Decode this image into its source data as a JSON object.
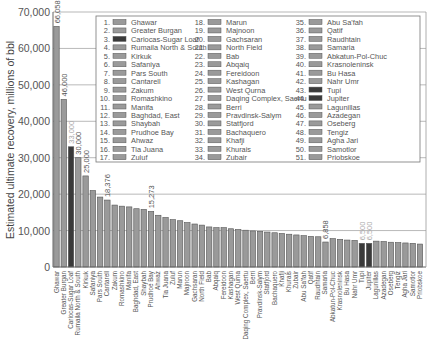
{
  "chart_data": {
    "type": "bar",
    "title": "",
    "xlabel": "",
    "ylabel": "Estimated ultimate recovery, millions of bbl",
    "ylim": [
      0,
      70000
    ],
    "yticks": [
      0,
      10000,
      20000,
      30000,
      40000,
      50000,
      60000,
      70000
    ],
    "ytick_labels": [
      "0",
      "10,000",
      "20,000",
      "30,000",
      "40,000",
      "50,000",
      "60,000",
      "70,000"
    ],
    "grid": true,
    "legend_position": "top-right",
    "colors": {
      "default": "#9a9a9a",
      "highlight": "#3a3a3a",
      "edge": "#555555"
    },
    "categories": [
      "Ghawar",
      "Greater Burgan",
      "Cariocas-Sugar Loaf",
      "Rumaila North & South",
      "Kirkuk",
      "Safaniya",
      "Pars South",
      "Cantarell",
      "Zakum",
      "Romashkino",
      "Manifa",
      "Baghdad, East",
      "Shaybah",
      "Prudhoe Bay",
      "Ahwaz",
      "Tia Juana",
      "Zuluf",
      "Marun",
      "Majnoon",
      "Gachsaran",
      "North Field",
      "Bab",
      "Abqaiq",
      "Fereidoon",
      "Kashagan",
      "West Qurna",
      "Daqing Complex, Saertu",
      "Berri",
      "Pravdinsk-Salym",
      "Statfjord",
      "Bachaquero",
      "Khafji",
      "Khurais",
      "Zubair",
      "Abu Sa'fah",
      "Qatif",
      "Raudhtain",
      "Samaria",
      "Abkatun-Pol-Chuc",
      "Krasnoleninsk",
      "Bu Hasa",
      "Nahr Umr",
      "Tupi",
      "Jupiter",
      "Lagunillas",
      "Azadegan",
      "Oseberg",
      "Tengiz",
      "Agha Jari",
      "Samotlor",
      "Priobskoe"
    ],
    "values": [
      66058,
      46000,
      33000,
      30000,
      25000,
      21000,
      19200,
      18376,
      17000,
      16700,
      16500,
      16000,
      15800,
      15273,
      14200,
      13600,
      13000,
      12700,
      12200,
      11800,
      11500,
      11000,
      10800,
      10800,
      10500,
      10300,
      10100,
      9900,
      9800,
      9600,
      9400,
      9200,
      9000,
      8800,
      8600,
      8400,
      8300,
      6858,
      7800,
      7600,
      7400,
      7300,
      6500,
      6500,
      7100,
      7000,
      6800,
      6700,
      6600,
      6500,
      6300
    ],
    "highlight": [
      "Cariocas-Sugar Loaf",
      "Tupi",
      "Jupiter"
    ],
    "data_labels": [
      {
        "category": "Ghawar",
        "text": "66,058",
        "style": "normal"
      },
      {
        "category": "Greater Burgan",
        "text": "46,000",
        "style": "normal"
      },
      {
        "category": "Cariocas-Sugar Loaf",
        "text": "33,000",
        "style": "light"
      },
      {
        "category": "Rumaila North & South",
        "text": "30,000",
        "style": "normal"
      },
      {
        "category": "Kirkuk",
        "text": "25,000",
        "style": "normal"
      },
      {
        "category": "Cantarell",
        "text": "18,376",
        "style": "normal"
      },
      {
        "category": "Prudhoe Bay",
        "text": "15,273",
        "style": "normal"
      },
      {
        "category": "Samaria",
        "text": "6,858",
        "style": "normal"
      },
      {
        "category": "Tupi",
        "text": "6,500",
        "style": "light"
      },
      {
        "category": "Jupiter",
        "text": "6,500",
        "style": "light"
      }
    ]
  }
}
